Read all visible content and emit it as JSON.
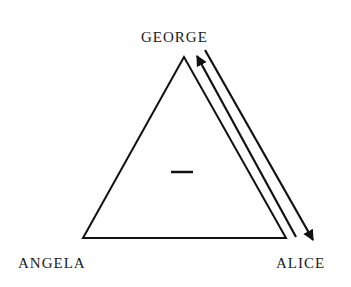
{
  "diagram": {
    "type": "balance-triad",
    "nodes": {
      "top": "GEORGE",
      "bottom_left": "ANGELA",
      "bottom_right": "ALICE"
    },
    "center_sign": "–",
    "relations": [
      {
        "from": "ALICE",
        "to": "GEORGE",
        "direction": "up-arrow"
      },
      {
        "from": "GEORGE",
        "to": "ALICE",
        "direction": "down-arrow"
      }
    ],
    "colors": {
      "ink": "#111111",
      "background": "#ffffff"
    }
  }
}
